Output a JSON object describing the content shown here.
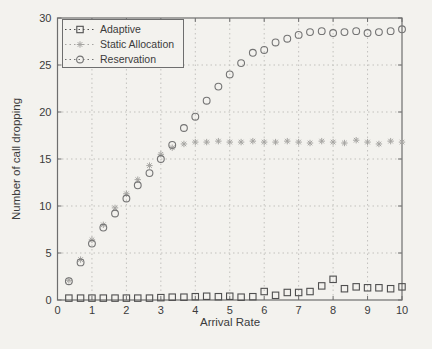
{
  "figure": {
    "background": "#f3f2ee",
    "axis_color": "#6e6e6e",
    "grid_color": "#c2c1bd",
    "text_color": "#3b3b3b"
  },
  "chart_data": {
    "type": "scatter",
    "title": "",
    "xlabel": "Arrival Rate",
    "ylabel": "Number of call dropping",
    "xlim": [
      0,
      10
    ],
    "ylim": [
      0,
      30
    ],
    "x_ticks": [
      0,
      1,
      2,
      3,
      4,
      5,
      6,
      7,
      8,
      9,
      10
    ],
    "y_ticks": [
      0,
      5,
      10,
      15,
      20,
      25,
      30
    ],
    "grid": true,
    "legend_position": "top-left",
    "x": [
      0.33,
      0.67,
      1.0,
      1.33,
      1.67,
      2.0,
      2.33,
      2.67,
      3.0,
      3.33,
      3.67,
      4.0,
      4.33,
      4.67,
      5.0,
      5.33,
      5.67,
      6.0,
      6.33,
      6.67,
      7.0,
      7.33,
      7.67,
      8.0,
      8.33,
      8.67,
      9.0,
      9.33,
      9.67,
      10.0
    ],
    "series": [
      {
        "name": "Adaptive",
        "marker": "square",
        "color": "#4f4f4f",
        "values": [
          0.2,
          0.2,
          0.2,
          0.2,
          0.2,
          0.2,
          0.2,
          0.2,
          0.25,
          0.3,
          0.3,
          0.35,
          0.4,
          0.35,
          0.4,
          0.3,
          0.35,
          0.9,
          0.5,
          0.8,
          0.8,
          0.9,
          1.5,
          2.2,
          1.2,
          1.4,
          1.3,
          1.3,
          1.2,
          1.4
        ]
      },
      {
        "name": "Static Allocation",
        "marker": "asterisk",
        "color": "#a6a5a2",
        "values": [
          2.1,
          4.3,
          6.4,
          8.0,
          9.8,
          11.3,
          12.8,
          14.3,
          15.5,
          16.2,
          16.6,
          16.8,
          16.8,
          16.9,
          16.8,
          16.8,
          16.9,
          16.8,
          16.8,
          16.9,
          16.8,
          16.7,
          16.9,
          16.8,
          16.7,
          17.0,
          16.8,
          16.6,
          16.9,
          16.8
        ]
      },
      {
        "name": "Reservation",
        "marker": "circle",
        "color": "#747474",
        "values": [
          2.0,
          4.0,
          6.0,
          7.7,
          9.2,
          10.8,
          12.2,
          13.5,
          15.0,
          16.5,
          18.3,
          19.5,
          21.2,
          22.7,
          24.0,
          25.2,
          26.3,
          26.6,
          27.4,
          27.8,
          28.2,
          28.5,
          28.6,
          28.4,
          28.5,
          28.6,
          28.4,
          28.5,
          28.6,
          28.8
        ]
      }
    ]
  }
}
